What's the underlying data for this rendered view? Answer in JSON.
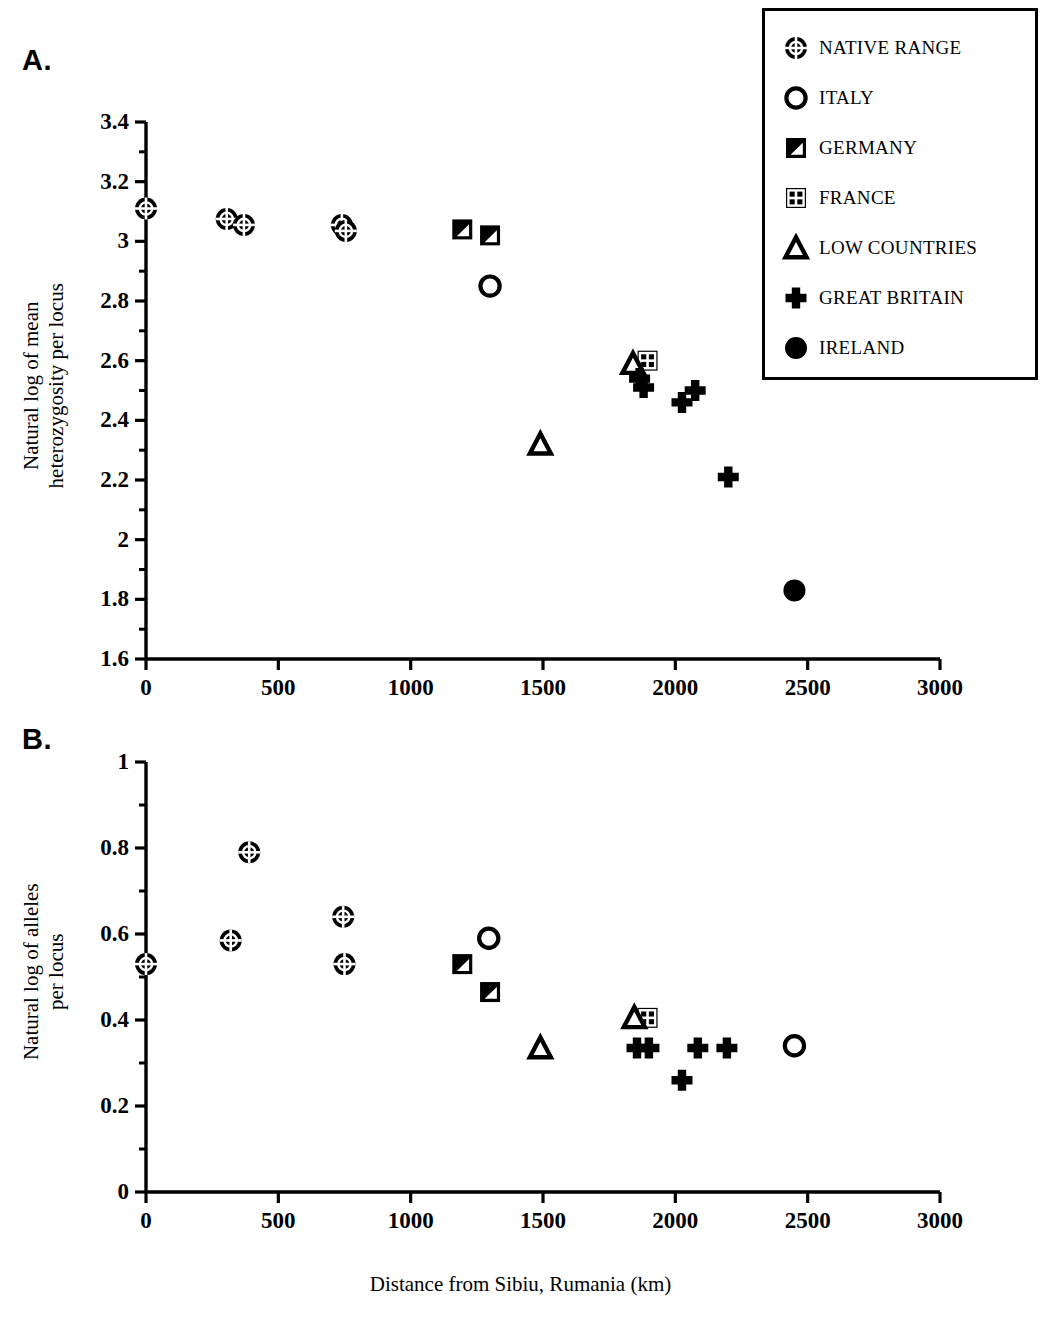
{
  "figure": {
    "panel_a_letter": "A.",
    "panel_b_letter": "B.",
    "xlabel": "Distance from Sibiu, Rumania (km)"
  },
  "legend": {
    "position": "top-right",
    "entries": [
      {
        "key": "native_range",
        "label": "NATIVE RANGE",
        "symbol": "circle-crosshatch"
      },
      {
        "key": "italy",
        "label": "ITALY",
        "symbol": "open-circle"
      },
      {
        "key": "germany",
        "label": "GERMANY",
        "symbol": "square-half-triangle"
      },
      {
        "key": "france",
        "label": "FRANCE",
        "symbol": "square-grid"
      },
      {
        "key": "low_countries",
        "label": "LOW COUNTRIES",
        "symbol": "open-triangle"
      },
      {
        "key": "great_britain",
        "label": "GREAT BRITAIN",
        "symbol": "filled-cross"
      },
      {
        "key": "ireland",
        "label": "IRELAND",
        "symbol": "filled-circle"
      }
    ]
  },
  "chart_data": [
    {
      "id": "panel_a",
      "type": "scatter",
      "title": "A.",
      "xlabel": "Distance from Sibiu, Rumania (km)",
      "ylabel": "Natural log of mean\nheterozygosity per locus",
      "xlim": [
        0,
        3000
      ],
      "ylim": [
        1.6,
        3.4
      ],
      "xticks": [
        0,
        500,
        1000,
        1500,
        2000,
        2500,
        3000
      ],
      "yticks": [
        1.6,
        1.8,
        2,
        2.2,
        2.4,
        2.6,
        2.8,
        3,
        3.2,
        3.4
      ],
      "xtick_labels": [
        "0",
        "500",
        "1000",
        "1500",
        "2000",
        "2500",
        "3000"
      ],
      "ytick_labels": [
        "1.6",
        "1.8",
        "2",
        "2.2",
        "2.4",
        "2.6",
        "2.8",
        "3",
        "3.2",
        "3.4"
      ],
      "grid": false,
      "series": [
        {
          "name": "NATIVE RANGE",
          "symbol": "circle-crosshatch",
          "points": [
            {
              "x": 0,
              "y": 3.11
            },
            {
              "x": 305,
              "y": 3.075
            },
            {
              "x": 370,
              "y": 3.055
            },
            {
              "x": 740,
              "y": 3.055
            },
            {
              "x": 755,
              "y": 3.035
            }
          ]
        },
        {
          "name": "ITALY",
          "symbol": "open-circle",
          "points": [
            {
              "x": 1300,
              "y": 2.85
            }
          ]
        },
        {
          "name": "GERMANY",
          "symbol": "square-half-triangle",
          "points": [
            {
              "x": 1195,
              "y": 3.04
            },
            {
              "x": 1300,
              "y": 3.02
            }
          ]
        },
        {
          "name": "FRANCE",
          "symbol": "square-grid",
          "points": [
            {
              "x": 1895,
              "y": 2.6
            }
          ]
        },
        {
          "name": "LOW COUNTRIES",
          "symbol": "open-triangle",
          "points": [
            {
              "x": 1490,
              "y": 2.32
            },
            {
              "x": 1840,
              "y": 2.59
            }
          ]
        },
        {
          "name": "GREAT BRITAIN",
          "symbol": "filled-cross",
          "points": [
            {
              "x": 1865,
              "y": 2.54
            },
            {
              "x": 1880,
              "y": 2.51
            },
            {
              "x": 2025,
              "y": 2.46
            },
            {
              "x": 2075,
              "y": 2.5
            },
            {
              "x": 2200,
              "y": 2.21
            }
          ]
        },
        {
          "name": "IRELAND",
          "symbol": "filled-circle",
          "points": [
            {
              "x": 2450,
              "y": 1.83
            }
          ]
        }
      ]
    },
    {
      "id": "panel_b",
      "type": "scatter",
      "title": "B.",
      "xlabel": "Distance from Sibiu, Rumania (km)",
      "ylabel": "Natural log of alleles\nper locus",
      "xlim": [
        0,
        3000
      ],
      "ylim": [
        0,
        1
      ],
      "xticks": [
        0,
        500,
        1000,
        1500,
        2000,
        2500,
        3000
      ],
      "yticks": [
        0,
        0.2,
        0.4,
        0.6,
        0.8,
        1
      ],
      "xtick_labels": [
        "0",
        "500",
        "1000",
        "1500",
        "2000",
        "2500",
        "3000"
      ],
      "ytick_labels": [
        "0",
        "0.2",
        "0.4",
        "0.6",
        "0.8",
        "1"
      ],
      "grid": false,
      "series": [
        {
          "name": "NATIVE RANGE",
          "symbol": "circle-crosshatch",
          "points": [
            {
              "x": 0,
              "y": 0.53
            },
            {
              "x": 320,
              "y": 0.585
            },
            {
              "x": 390,
              "y": 0.79
            },
            {
              "x": 745,
              "y": 0.64
            },
            {
              "x": 750,
              "y": 0.53
            }
          ]
        },
        {
          "name": "ITALY",
          "symbol": "open-circle",
          "points": [
            {
              "x": 1295,
              "y": 0.59
            },
            {
              "x": 2450,
              "y": 0.34
            }
          ]
        },
        {
          "name": "GERMANY",
          "symbol": "square-half-triangle",
          "points": [
            {
              "x": 1195,
              "y": 0.53
            },
            {
              "x": 1300,
              "y": 0.465
            }
          ]
        },
        {
          "name": "FRANCE",
          "symbol": "square-grid",
          "points": [
            {
              "x": 1895,
              "y": 0.405
            }
          ]
        },
        {
          "name": "LOW COUNTRIES",
          "symbol": "open-triangle",
          "points": [
            {
              "x": 1490,
              "y": 0.335
            },
            {
              "x": 1845,
              "y": 0.405
            }
          ]
        },
        {
          "name": "GREAT BRITAIN",
          "symbol": "filled-cross",
          "points": [
            {
              "x": 1855,
              "y": 0.335
            },
            {
              "x": 1900,
              "y": 0.335
            },
            {
              "x": 2025,
              "y": 0.26
            },
            {
              "x": 2085,
              "y": 0.335
            },
            {
              "x": 2195,
              "y": 0.335
            }
          ]
        }
      ]
    }
  ]
}
